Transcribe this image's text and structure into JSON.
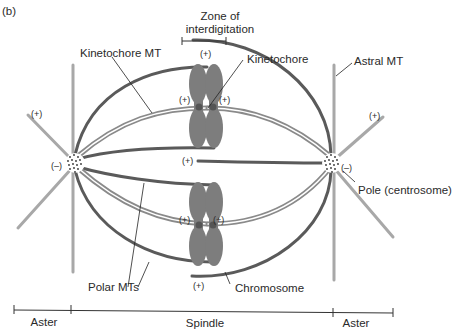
{
  "panel_label": "(b)",
  "labels": {
    "zone_line1": "Zone of",
    "zone_line2": "interdigitation",
    "kinetochore_mt": "Kinetochore MT",
    "kinetochore": "Kinetochore",
    "astral_mt": "Astral MT",
    "pole": "Pole (centrosome)",
    "polar_mts": "Polar MTs",
    "chromosome": "Chromosome"
  },
  "signs": {
    "plus": "(+)",
    "minus": "(–)"
  },
  "scale_bar": {
    "segments": [
      "Aster",
      "Spindle",
      "Aster"
    ]
  },
  "colors": {
    "polar_mt": "#5a5a5a",
    "kinetochore_mt": "#8a8a8a",
    "astral_mt": "#a8a8a8",
    "chromosome": "#7d7d7d",
    "centromere": "#555555",
    "text": "#2a2a2a"
  }
}
